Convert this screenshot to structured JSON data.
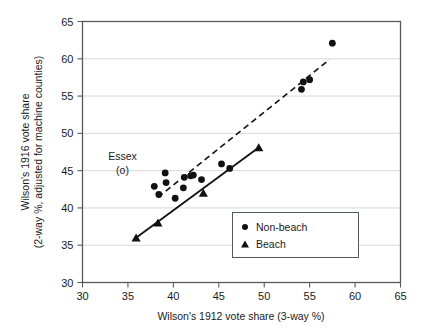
{
  "chart_data": {
    "type": "scatter",
    "title": "",
    "xlabel": "Wilson's 1912 vote share (3-way %)",
    "ylabel_line1": "Wilson's 1916 vote share",
    "ylabel_line2": "(2-way %, adjusted for machine counties)",
    "xlim": [
      30,
      65
    ],
    "ylim": [
      30,
      65
    ],
    "xticks": [
      30,
      35,
      40,
      45,
      50,
      55,
      60,
      65
    ],
    "yticks": [
      30,
      35,
      40,
      45,
      50,
      55,
      60,
      65
    ],
    "grid": "horizontal",
    "legend_position": "lower-right",
    "series": [
      {
        "name": "Non-beach",
        "marker": "circle",
        "points": [
          [
            37.9,
            42.9
          ],
          [
            38.4,
            41.8
          ],
          [
            39.1,
            44.7
          ],
          [
            39.2,
            43.4
          ],
          [
            40.2,
            41.3
          ],
          [
            41.1,
            42.7
          ],
          [
            41.2,
            44.1
          ],
          [
            41.9,
            44.3
          ],
          [
            42.2,
            44.4
          ],
          [
            43.1,
            43.8
          ],
          [
            45.3,
            45.9
          ],
          [
            46.2,
            45.3
          ],
          [
            54.1,
            55.9
          ],
          [
            54.3,
            56.9
          ],
          [
            55.0,
            57.2
          ],
          [
            57.5,
            62.1
          ]
        ]
      },
      {
        "name": "Beach",
        "marker": "triangle",
        "points": [
          [
            35.9,
            36.0
          ],
          [
            38.3,
            38.0
          ],
          [
            43.3,
            42.0
          ],
          [
            49.4,
            48.1
          ]
        ]
      }
    ],
    "fit_lines": [
      {
        "name": "beach-fit",
        "style": "solid",
        "x0": 35.9,
        "y0": 36.0,
        "x1": 49.4,
        "y1": 48.1
      },
      {
        "name": "non-beach-fit",
        "style": "dashed",
        "x0": 38.3,
        "y0": 41.4,
        "x1": 57.2,
        "y1": 59.9
      }
    ],
    "annotations": [
      {
        "name": "essex-annotation",
        "line1": "Essex",
        "line2": "(o)",
        "x": 34.4,
        "y": 46.4
      }
    ],
    "colors": {
      "marker": "#111111",
      "grid": "#d8d8d8",
      "frame": "#555a5e",
      "background": "#ffffff"
    }
  },
  "legend": {
    "items": [
      {
        "label": "Non-beach",
        "marker": "circle"
      },
      {
        "label": "Beach",
        "marker": "triangle"
      }
    ]
  },
  "axis": {
    "x_tick_labels": [
      "30",
      "35",
      "40",
      "45",
      "50",
      "55",
      "60",
      "65"
    ],
    "y_tick_labels": [
      "30",
      "35",
      "40",
      "45",
      "50",
      "55",
      "60",
      "65"
    ]
  }
}
